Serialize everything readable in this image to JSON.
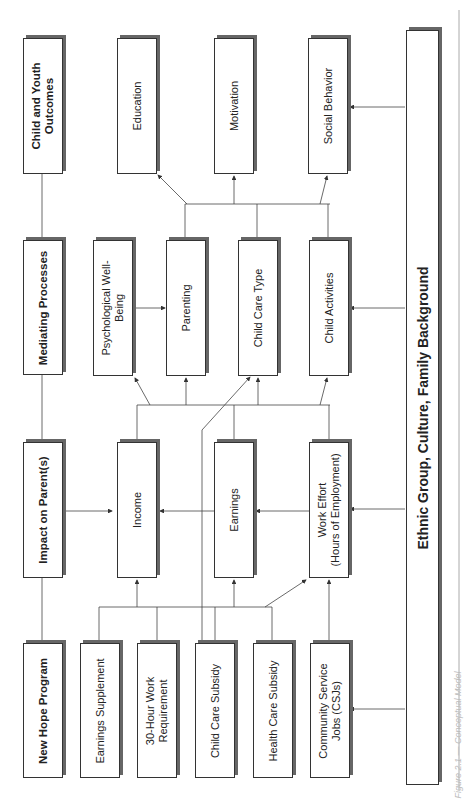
{
  "figure": {
    "caption": "Figure 2.1 — Conceptual Model",
    "orientation": "rotated 90° counter-clockwise"
  },
  "columns": {
    "program": {
      "header": "New Hope Program",
      "items": [
        "Earnings Supplement",
        "30-Hour Work Requirement",
        "Child Care Subsidy",
        "Health Care Subsidy",
        "Community Service Jobs (CSJs)"
      ]
    },
    "parents": {
      "header": "Impact on Parent(s)",
      "items": [
        "Income",
        "Earnings",
        "Work Effort (Hours of Employment)"
      ]
    },
    "mediating": {
      "header": "Mediating Processes",
      "items": [
        "Psychological Well-Being",
        "Parenting",
        "Child Care Type",
        "Child Activities"
      ]
    },
    "outcomes": {
      "header": "Child and Youth Outcomes",
      "items": [
        "Education",
        "Motivation",
        "Social Behavior"
      ]
    }
  },
  "labels": {
    "new_hope": "New Hope Program",
    "earnings_supplement": "Earnings Supplement",
    "work_req_1": "30-Hour Work",
    "work_req_2": "Requirement",
    "child_care_subsidy": "Child Care Subsidy",
    "health_care_subsidy": "Health Care Subsidy",
    "csj_1": "Community Service",
    "csj_2": "Jobs (CSJs)",
    "impact": "Impact on Parent(s)",
    "income": "Income",
    "earnings": "Earnings",
    "work_effort_1": "Work Effort",
    "work_effort_2": "(Hours of Employment)",
    "mediating": "Mediating Processes",
    "psych_1": "Psychological Well-",
    "psych_2": "Being",
    "parenting": "Parenting",
    "child_care_type": "Child Care Type",
    "child_activities": "Child Activities",
    "outcomes_1": "Child and Youth",
    "outcomes_2": "Outcomes",
    "education": "Education",
    "motivation": "Motivation",
    "social_behavior": "Social Behavior",
    "background": "Ethnic Group, Culture, Family Background"
  },
  "colors": {
    "line": "#444444",
    "box_border": "#333333",
    "shadow": "#666666",
    "text": "#222222"
  }
}
